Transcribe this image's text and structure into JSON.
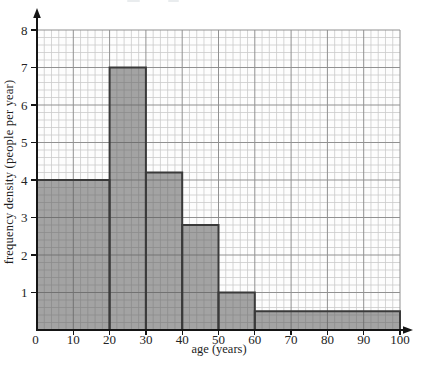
{
  "chart_data": {
    "type": "bar",
    "subtype": "histogram",
    "title": "",
    "xlabel": "age (years)",
    "ylabel": "frequency density (people per year)",
    "xlim": [
      0,
      100
    ],
    "ylim": [
      0,
      8
    ],
    "x_ticks": [
      0,
      10,
      20,
      30,
      40,
      50,
      60,
      70,
      80,
      90,
      100
    ],
    "y_ticks": [
      1,
      2,
      3,
      4,
      5,
      6,
      7,
      8
    ],
    "grid": {
      "visible": true,
      "minor_x_step_years": 2,
      "minor_y_step_density": 0.2,
      "major_x_step_years": 10,
      "major_y_step_density": 1
    },
    "bars": [
      {
        "age_from": 0,
        "age_to": 20,
        "frequency_density": 4
      },
      {
        "age_from": 20,
        "age_to": 30,
        "frequency_density": 7
      },
      {
        "age_from": 30,
        "age_to": 40,
        "frequency_density": 4.2
      },
      {
        "age_from": 40,
        "age_to": 50,
        "frequency_density": 2.8
      },
      {
        "age_from": 50,
        "age_to": 60,
        "frequency_density": 1
      },
      {
        "age_from": 60,
        "age_to": 100,
        "frequency_density": 0.5
      }
    ],
    "style": {
      "bar_fill": "rgba(90,90,90,0.55)",
      "bar_border": "#3a3a3a",
      "minor_grid_color": "#cacaca",
      "major_grid_color": "#919191",
      "axis_color": "#151515",
      "tick_label_color": "#242424",
      "plot_background": "#fdfdfd"
    }
  }
}
